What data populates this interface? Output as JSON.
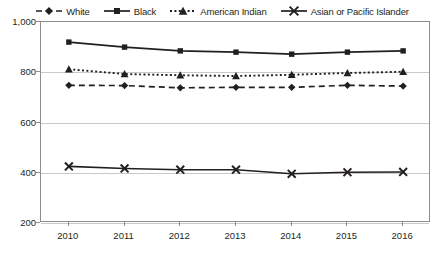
{
  "chart_data": {
    "type": "line",
    "title": "",
    "subtitle": "",
    "xlabel": "",
    "ylabel": "",
    "categories": [
      "2010",
      "2011",
      "2012",
      "2013",
      "2014",
      "2015",
      "2016"
    ],
    "x": [
      2010,
      2011,
      2012,
      2013,
      2014,
      2015,
      2016
    ],
    "ylim": [
      200,
      1000
    ],
    "yticks": [
      200,
      400,
      600,
      800,
      1000
    ],
    "ytick_labels": [
      "200",
      "400",
      "600",
      "800",
      "1,000"
    ],
    "grid": true,
    "legend_position": "top",
    "series": [
      {
        "name": "White",
        "marker": "diamond",
        "line_style": "dashed",
        "color": "#231f20",
        "values": [
          748,
          747,
          738,
          740,
          740,
          748,
          745
        ]
      },
      {
        "name": "Black",
        "marker": "square",
        "line_style": "solid",
        "color": "#231f20",
        "values": [
          920,
          900,
          885,
          880,
          872,
          880,
          885
        ]
      },
      {
        "name": "American Indian",
        "marker": "triangle",
        "line_style": "dotted",
        "color": "#231f20",
        "values": [
          812,
          793,
          788,
          785,
          790,
          797,
          802
        ]
      },
      {
        "name": "Asian or Pacific Islander",
        "marker": "x",
        "line_style": "solid",
        "color": "#231f20",
        "values": [
          425,
          417,
          412,
          412,
          396,
          402,
          403
        ]
      }
    ]
  },
  "legend": {
    "items": [
      {
        "label": "White",
        "marker": "diamond-marker",
        "line": "dashed"
      },
      {
        "label": "Black",
        "marker": "square-marker",
        "line": "solid"
      },
      {
        "label": "American Indian",
        "marker": "triangle-marker",
        "line": "dotted"
      },
      {
        "label": "Asian or Pacific Islander",
        "marker": "x-marker",
        "line": "solid"
      }
    ]
  },
  "colors": {
    "ink": "#231f20",
    "axis": "#8d8d8d",
    "grid": "#c9c9c9",
    "background": "#ffffff"
  }
}
